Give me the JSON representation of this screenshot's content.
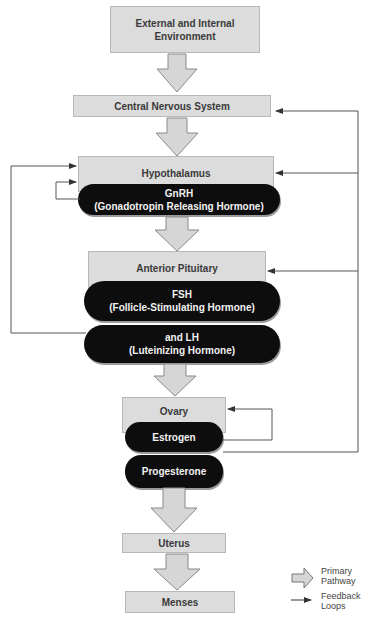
{
  "diagram": {
    "nodes": {
      "environment": "External and Internal Environment",
      "cns": "Central Nervous System",
      "hypothalamus": "Hypothalamus",
      "gnrh_title": "GnRH",
      "gnrh_sub": "(Gonadotropin Releasing Hormone)",
      "pituitary": "Anterior Pituitary",
      "fsh_title": "FSH",
      "fsh_sub": "(Follicle-Stimulating Hormone)",
      "lh_title": "and LH",
      "lh_sub": "(Luteinizing Hormone)",
      "ovary": "Ovary",
      "estrogen": "Estrogen",
      "progesterone": "Progesterone",
      "uterus": "Uterus",
      "menses": "Menses"
    },
    "legend": {
      "primary": "Primary Pathway",
      "feedback": "Feedback Loops"
    },
    "colors": {
      "box_fill": "#dcdcdc",
      "pill_fill": "#0d0d0d",
      "line": "#555555"
    }
  }
}
